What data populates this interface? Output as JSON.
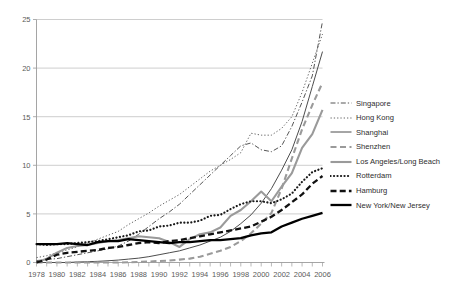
{
  "chart_data": {
    "type": "line",
    "title": "",
    "xlabel": "",
    "ylabel": "",
    "xlim": [
      1978,
      2006
    ],
    "ylim": [
      0,
      25
    ],
    "yticks": [
      0,
      5,
      10,
      15,
      20,
      25
    ],
    "xticks": [
      1978,
      1979,
      1980,
      1981,
      1982,
      1983,
      1984,
      1985,
      1986,
      1987,
      1988,
      1989,
      1990,
      1991,
      1992,
      1993,
      1994,
      1995,
      1996,
      1997,
      1998,
      1999,
      2000,
      2001,
      2002,
      2003,
      2004,
      2005,
      2006
    ],
    "xtick_labels": [
      "1978",
      "1980",
      "1982",
      "1984",
      "1986",
      "1988",
      "1990",
      "1992",
      "1994",
      "1996",
      "1998",
      "2000",
      "2002",
      "2004",
      "2006"
    ],
    "xtick_label_years": [
      1978,
      1980,
      1982,
      1984,
      1986,
      1988,
      1990,
      1992,
      1994,
      1996,
      1998,
      2000,
      2002,
      2004,
      2006
    ],
    "grid": "horizontal",
    "legend_position": "right",
    "x": [
      1978,
      1979,
      1980,
      1981,
      1982,
      1983,
      1984,
      1985,
      1986,
      1987,
      1988,
      1989,
      1990,
      1991,
      1992,
      1993,
      1994,
      1995,
      1996,
      1997,
      1998,
      1999,
      2000,
      2001,
      2002,
      2003,
      2004,
      2005,
      2006
    ],
    "series": [
      {
        "name": "Singapore",
        "style": "dash-dot",
        "color": "#555555",
        "width": 1.0,
        "values": [
          0.2,
          0.3,
          0.4,
          0.6,
          0.8,
          1.0,
          1.2,
          1.4,
          1.7,
          2.2,
          2.9,
          3.7,
          4.5,
          5.2,
          6.0,
          7.0,
          8.0,
          9.0,
          10.0,
          11.0,
          12.0,
          12.3,
          11.6,
          11.4,
          12.0,
          14.0,
          16.5,
          19.2,
          24.8
        ]
      },
      {
        "name": "Hong Kong",
        "style": "dotted",
        "color": "#666666",
        "width": 1.0,
        "values": [
          0.5,
          0.7,
          1.0,
          1.3,
          1.6,
          2.0,
          2.4,
          2.8,
          3.2,
          3.9,
          4.5,
          5.1,
          5.8,
          6.4,
          7.0,
          7.8,
          8.6,
          9.4,
          10.0,
          10.6,
          11.3,
          13.3,
          13.1,
          13.1,
          13.8,
          15.0,
          17.5,
          20.5,
          23.5
        ]
      },
      {
        "name": "Shanghai",
        "style": "solid-thin",
        "color": "#4d4d4d",
        "width": 1.0,
        "values": [
          0.0,
          0.0,
          0.0,
          0.0,
          0.05,
          0.08,
          0.12,
          0.18,
          0.25,
          0.35,
          0.45,
          0.6,
          0.8,
          1.0,
          1.2,
          1.5,
          1.8,
          2.2,
          2.6,
          3.2,
          4.0,
          4.9,
          6.1,
          7.6,
          9.5,
          11.6,
          14.5,
          18.1,
          21.7
        ]
      },
      {
        "name": "Shenzhen",
        "style": "dashed-gray",
        "color": "#9a9a9a",
        "width": 2.1,
        "values": [
          0.0,
          0.0,
          0.0,
          0.0,
          0.0,
          0.0,
          0.0,
          0.0,
          0.0,
          0.02,
          0.05,
          0.1,
          0.15,
          0.2,
          0.3,
          0.4,
          0.6,
          0.9,
          1.2,
          1.6,
          2.2,
          3.0,
          4.0,
          5.1,
          7.6,
          10.7,
          13.7,
          16.2,
          18.5
        ]
      },
      {
        "name": "Los Angeles/Long Beach",
        "style": "solid-gray",
        "color": "#9a9a9a",
        "width": 2.1,
        "values": [
          0.0,
          0.4,
          1.0,
          1.5,
          1.7,
          1.8,
          2.0,
          2.2,
          2.3,
          2.5,
          2.7,
          2.6,
          2.5,
          2.1,
          1.6,
          2.4,
          2.9,
          3.1,
          3.6,
          4.8,
          5.4,
          6.3,
          7.3,
          6.3,
          7.8,
          9.2,
          11.8,
          13.2,
          15.7
        ]
      },
      {
        "name": "Rotterdam",
        "style": "dotted-thick",
        "color": "#1a1a1a",
        "width": 2.2,
        "values": [
          1.9,
          1.8,
          1.9,
          1.9,
          2.0,
          2.1,
          2.2,
          2.4,
          2.6,
          2.8,
          3.2,
          3.3,
          3.7,
          3.8,
          4.1,
          4.1,
          4.3,
          4.8,
          4.9,
          5.5,
          6.0,
          6.3,
          6.3,
          6.1,
          6.5,
          7.1,
          8.3,
          9.3,
          9.7
        ]
      },
      {
        "name": "Hamburg",
        "style": "dashed-black",
        "color": "#111111",
        "width": 2.3,
        "values": [
          0.0,
          0.3,
          0.8,
          1.0,
          1.1,
          1.2,
          1.3,
          1.5,
          1.6,
          1.8,
          2.0,
          2.1,
          2.0,
          2.2,
          2.3,
          2.5,
          2.7,
          2.9,
          3.1,
          3.3,
          3.5,
          3.7,
          4.2,
          4.7,
          5.4,
          6.2,
          7.0,
          8.1,
          8.9
        ]
      },
      {
        "name": "New York/New Jersey",
        "style": "solid-black",
        "color": "#000000",
        "width": 2.3,
        "values": [
          1.9,
          1.9,
          1.9,
          2.0,
          1.9,
          1.8,
          2.1,
          2.2,
          2.2,
          2.4,
          2.3,
          2.2,
          2.1,
          2.0,
          2.1,
          2.1,
          2.2,
          2.3,
          2.3,
          2.4,
          2.5,
          2.8,
          3.0,
          3.1,
          3.7,
          4.1,
          4.5,
          4.8,
          5.1
        ]
      }
    ]
  },
  "legend": {
    "items": [
      {
        "label": "Singapore",
        "style": "dash-dot"
      },
      {
        "label": "Hong Kong",
        "style": "dotted"
      },
      {
        "label": "Shanghai",
        "style": "solid-thin"
      },
      {
        "label": "Shenzhen",
        "style": "dashed-gray"
      },
      {
        "label": "Los Angeles/Long Beach",
        "style": "solid-gray"
      },
      {
        "label": "Rotterdam",
        "style": "dotted-thick"
      },
      {
        "label": "Hamburg",
        "style": "dashed-black"
      },
      {
        "label": "New York/New Jersey",
        "style": "solid-black"
      }
    ]
  },
  "colors": {
    "axis": "#9b9b9b",
    "grid": "#b9b9b9",
    "text": "#444444",
    "background": "#ffffff"
  }
}
